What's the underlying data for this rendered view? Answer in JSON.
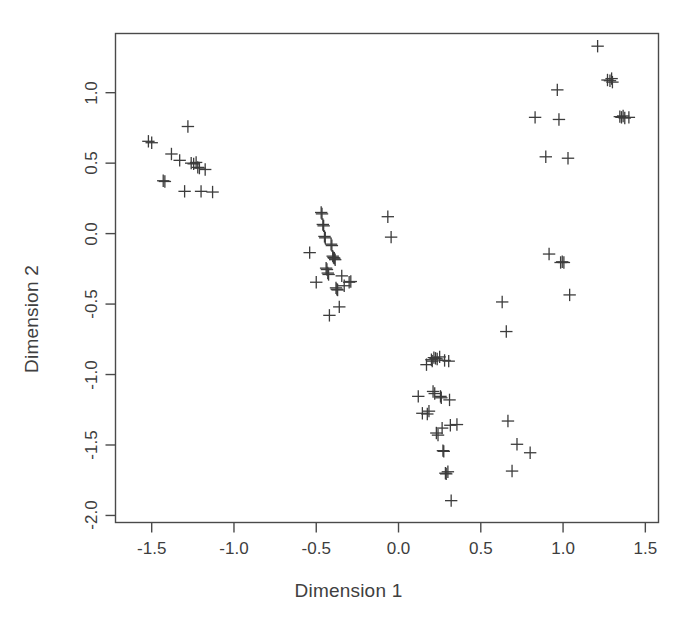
{
  "chart_data": {
    "type": "scatter",
    "title": "",
    "xlabel": "Dimension 1",
    "ylabel": "Dimension 2",
    "xlim": [
      -1.72,
      1.58
    ],
    "ylim": [
      -2.05,
      1.42
    ],
    "xticks": [
      -1.5,
      -1.0,
      -0.5,
      0.0,
      0.5,
      1.0,
      1.5
    ],
    "xtick_labels": [
      "-1.5",
      "-1.0",
      "-0.5",
      "0.0",
      "0.5",
      "1.0",
      "1.5"
    ],
    "yticks": [
      1.0,
      0.5,
      0.0,
      -0.5,
      -1.0,
      -1.5,
      -2.0
    ],
    "ytick_labels": [
      "1.0",
      "0.5",
      "0.0",
      "-0.5",
      "-1.0",
      "-1.5",
      "-2.0"
    ],
    "grid": false,
    "legend": null,
    "marker": "plus",
    "marker_color": "#3c3c3c",
    "frame_color": "#4a4a4a",
    "background": "#ffffff",
    "series": [
      {
        "name": "points",
        "points": [
          [
            -1.52,
            0.655
          ],
          [
            -1.5,
            0.645
          ],
          [
            -1.43,
            0.375
          ],
          [
            -1.42,
            0.37
          ],
          [
            -1.38,
            0.565
          ],
          [
            -1.33,
            0.52
          ],
          [
            -1.3,
            0.3
          ],
          [
            -1.28,
            0.76
          ],
          [
            -1.26,
            0.5
          ],
          [
            -1.245,
            0.495
          ],
          [
            -1.23,
            0.505
          ],
          [
            -1.22,
            0.47
          ],
          [
            -1.21,
            0.465
          ],
          [
            -1.2,
            0.3
          ],
          [
            -1.175,
            0.455
          ],
          [
            -1.13,
            0.295
          ],
          [
            -0.54,
            -0.135
          ],
          [
            -0.5,
            -0.345
          ],
          [
            -0.47,
            0.15
          ],
          [
            -0.465,
            0.14
          ],
          [
            -0.46,
            0.065
          ],
          [
            -0.455,
            0.055
          ],
          [
            -0.45,
            -0.02
          ],
          [
            -0.445,
            -0.03
          ],
          [
            -0.44,
            -0.245
          ],
          [
            -0.435,
            -0.255
          ],
          [
            -0.43,
            -0.28
          ],
          [
            -0.425,
            -0.29
          ],
          [
            -0.42,
            -0.58
          ],
          [
            -0.41,
            -0.075
          ],
          [
            -0.405,
            -0.085
          ],
          [
            -0.4,
            -0.16
          ],
          [
            -0.395,
            -0.17
          ],
          [
            -0.39,
            -0.175
          ],
          [
            -0.385,
            -0.185
          ],
          [
            -0.38,
            -0.385
          ],
          [
            -0.375,
            -0.395
          ],
          [
            -0.37,
            -0.4
          ],
          [
            -0.36,
            -0.52
          ],
          [
            -0.345,
            -0.3
          ],
          [
            -0.33,
            -0.37
          ],
          [
            -0.3,
            -0.345
          ],
          [
            -0.29,
            -0.34
          ],
          [
            -0.065,
            0.12
          ],
          [
            -0.045,
            -0.025
          ],
          [
            0.12,
            -1.155
          ],
          [
            0.145,
            -1.275
          ],
          [
            0.17,
            -0.93
          ],
          [
            0.175,
            -1.28
          ],
          [
            0.185,
            -1.26
          ],
          [
            0.2,
            -0.895
          ],
          [
            0.205,
            -0.905
          ],
          [
            0.21,
            -1.12
          ],
          [
            0.215,
            -0.88
          ],
          [
            0.22,
            -1.135
          ],
          [
            0.225,
            -0.885
          ],
          [
            0.23,
            -1.415
          ],
          [
            0.235,
            -0.89
          ],
          [
            0.24,
            -1.43
          ],
          [
            0.25,
            -0.875
          ],
          [
            0.255,
            -1.155
          ],
          [
            0.26,
            -1.165
          ],
          [
            0.265,
            -1.38
          ],
          [
            0.27,
            -1.54
          ],
          [
            0.275,
            -1.545
          ],
          [
            0.28,
            -0.9
          ],
          [
            0.285,
            -1.7
          ],
          [
            0.29,
            -1.705
          ],
          [
            0.3,
            -1.69
          ],
          [
            0.305,
            -0.905
          ],
          [
            0.31,
            -1.18
          ],
          [
            0.315,
            -1.36
          ],
          [
            0.32,
            -1.895
          ],
          [
            0.355,
            -1.355
          ],
          [
            0.63,
            -0.485
          ],
          [
            0.655,
            -0.695
          ],
          [
            0.665,
            -1.33
          ],
          [
            0.69,
            -1.685
          ],
          [
            0.72,
            -1.495
          ],
          [
            0.8,
            -1.555
          ],
          [
            0.83,
            0.825
          ],
          [
            0.895,
            0.545
          ],
          [
            0.915,
            -0.145
          ],
          [
            0.965,
            1.02
          ],
          [
            0.975,
            0.81
          ],
          [
            0.985,
            -0.205
          ],
          [
            0.995,
            -0.2
          ],
          [
            1.005,
            -0.205
          ],
          [
            1.03,
            0.535
          ],
          [
            1.04,
            -0.435
          ],
          [
            1.21,
            1.33
          ],
          [
            1.27,
            1.09
          ],
          [
            1.285,
            1.085
          ],
          [
            1.295,
            1.1
          ],
          [
            1.3,
            1.075
          ],
          [
            1.345,
            0.83
          ],
          [
            1.355,
            0.825
          ],
          [
            1.365,
            0.835
          ],
          [
            1.375,
            0.82
          ],
          [
            1.4,
            0.825
          ]
        ]
      }
    ]
  }
}
